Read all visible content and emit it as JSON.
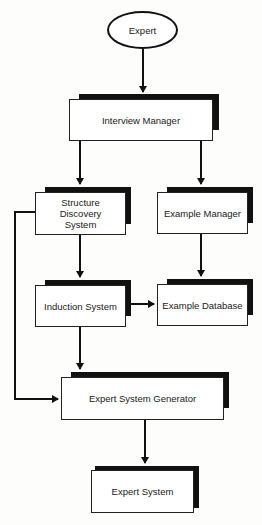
{
  "diagram": {
    "type": "flowchart",
    "nodes": {
      "expert": {
        "label": "Expert",
        "shape": "ellipse"
      },
      "interview_manager": {
        "label": "Interview Manager",
        "shape": "box"
      },
      "structure_discovery": {
        "label": "Structure\nDiscovery\nSystem",
        "shape": "box"
      },
      "example_manager": {
        "label": "Example Manager",
        "shape": "box"
      },
      "induction_system": {
        "label": "Induction System",
        "shape": "box"
      },
      "example_database": {
        "label": "Example Database",
        "shape": "box"
      },
      "expert_system_generator": {
        "label": "Expert System Generator",
        "shape": "box"
      },
      "expert_system": {
        "label": "Expert System",
        "shape": "box"
      }
    },
    "edges": [
      {
        "from": "Expert",
        "to": "Interview Manager"
      },
      {
        "from": "Interview Manager",
        "to": "Structure Discovery System"
      },
      {
        "from": "Interview Manager",
        "to": "Example Manager"
      },
      {
        "from": "Structure Discovery System",
        "to": "Induction System"
      },
      {
        "from": "Example Manager",
        "to": "Example Database"
      },
      {
        "from": "Induction System",
        "to": "Example Database"
      },
      {
        "from": "Induction System",
        "to": "Expert System Generator"
      },
      {
        "from": "Structure Discovery System",
        "to": "Expert System Generator"
      },
      {
        "from": "Expert System Generator",
        "to": "Expert System"
      }
    ],
    "colors": {
      "line": "#111111",
      "box_fill": "#ffffff",
      "shadow": "#111111"
    }
  }
}
